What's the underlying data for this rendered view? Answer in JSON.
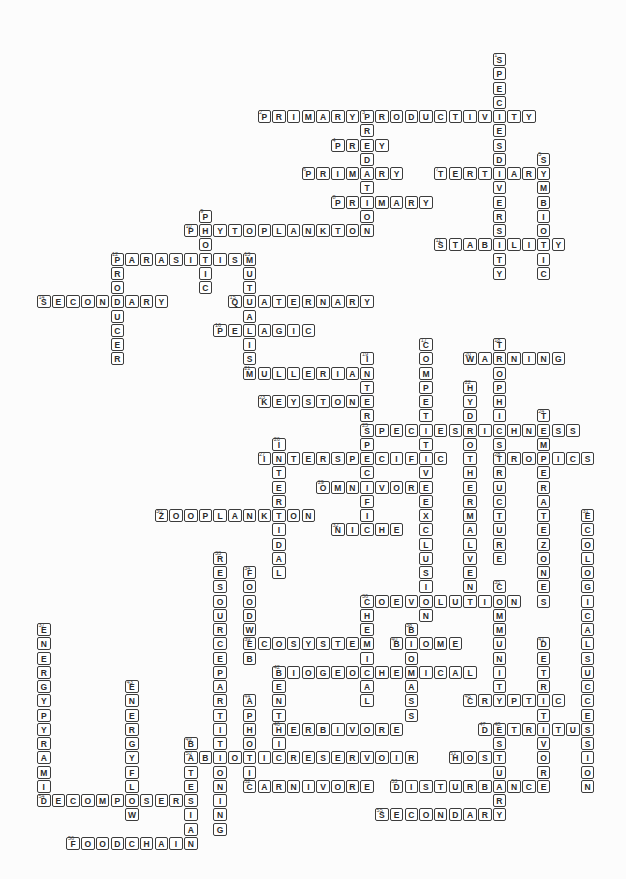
{
  "puzzle": {
    "type": "crossword",
    "state": "filled-in answers, no visible title or clue list",
    "grid": {
      "rows": 56,
      "cols": 38
    },
    "colors": {
      "paper": "#fcfcfc",
      "cell_fill": "#ffffff",
      "ink": "#3c3c3c",
      "letter_ink": "#2b2b2b",
      "number_ink": "#444444"
    },
    "words": [
      {
        "number": 1,
        "dir": "down",
        "row": 0,
        "col": 31,
        "answer": "SPECIESDIVERSITY"
      },
      {
        "number": 2,
        "dir": "across",
        "row": 4,
        "col": 15,
        "answer": "PRIMARYPRODUCTIVITY"
      },
      {
        "number": 3,
        "dir": "down",
        "row": 4,
        "col": 22,
        "answer": "PREDATION"
      },
      {
        "number": 4,
        "dir": "across",
        "row": 6,
        "col": 20,
        "answer": "PREY"
      },
      {
        "number": 5,
        "dir": "down",
        "row": 7,
        "col": 34,
        "answer": "SYMBIOTIC"
      },
      {
        "number": 6,
        "dir": "across",
        "row": 8,
        "col": 18,
        "answer": "PRIMARY"
      },
      {
        "number": 7,
        "dir": "across",
        "row": 8,
        "col": 27,
        "answer": "TERTIARY"
      },
      {
        "number": 8,
        "dir": "across",
        "row": 10,
        "col": 20,
        "answer": "PRIMARY"
      },
      {
        "number": 9,
        "dir": "down",
        "row": 11,
        "col": 11,
        "answer": "PHOTIC"
      },
      {
        "number": 10,
        "dir": "across",
        "row": 12,
        "col": 10,
        "answer": "PHYTOPLANKTON"
      },
      {
        "number": 11,
        "dir": "across",
        "row": 13,
        "col": 27,
        "answer": "STABILITY"
      },
      {
        "number": 12,
        "dir": "across",
        "row": 14,
        "col": 5,
        "answer": "PARASITISM"
      },
      {
        "number": 12,
        "dir": "down",
        "row": 14,
        "col": 5,
        "answer": "PRODUCER"
      },
      {
        "number": 13,
        "dir": "down",
        "row": 14,
        "col": 14,
        "answer": "MUTUALISM"
      },
      {
        "number": 14,
        "dir": "across",
        "row": 17,
        "col": 0,
        "answer": "SECONDARY"
      },
      {
        "number": 15,
        "dir": "across",
        "row": 17,
        "col": 13,
        "answer": "QUATERNARY"
      },
      {
        "number": 16,
        "dir": "across",
        "row": 19,
        "col": 12,
        "answer": "PELAGIC"
      },
      {
        "number": 17,
        "dir": "down",
        "row": 20,
        "col": 26,
        "answer": "COMPETITIVEEXCLUSION"
      },
      {
        "number": 18,
        "dir": "down",
        "row": 20,
        "col": 31,
        "answer": "TROPHICSTRUCTURE"
      },
      {
        "number": 19,
        "dir": "down",
        "row": 21,
        "col": 22,
        "answer": "INTERSPECIFIC"
      },
      {
        "number": 20,
        "dir": "across",
        "row": 21,
        "col": 29,
        "answer": "WARNING"
      },
      {
        "number": 21,
        "dir": "across",
        "row": 22,
        "col": 14,
        "answer": "MULLERIAN"
      },
      {
        "number": 22,
        "dir": "down",
        "row": 23,
        "col": 29,
        "answer": "HYDROTHERMALVENT"
      },
      {
        "number": 23,
        "dir": "across",
        "row": 24,
        "col": 15,
        "answer": "KEYSTONE"
      },
      {
        "number": 24,
        "dir": "down",
        "row": 25,
        "col": 34,
        "answer": "TEMPERATEZONES"
      },
      {
        "number": 25,
        "dir": "across",
        "row": 26,
        "col": 22,
        "answer": "SPECIESRICHNESS"
      },
      {
        "number": 26,
        "dir": "down",
        "row": 27,
        "col": 16,
        "answer": "INTERTIDAL"
      },
      {
        "number": 27,
        "dir": "across",
        "row": 28,
        "col": 15,
        "answer": "INTERSPECIFIC"
      },
      {
        "number": 28,
        "dir": "across",
        "row": 28,
        "col": 31,
        "answer": "TROPICS"
      },
      {
        "number": 29,
        "dir": "across",
        "row": 30,
        "col": 19,
        "answer": "OMNIVORE"
      },
      {
        "number": 30,
        "dir": "across",
        "row": 32,
        "col": 8,
        "answer": "ZOOPLANKTON"
      },
      {
        "number": 31,
        "dir": "down",
        "row": 32,
        "col": 37,
        "answer": "ECOLOGICALSUCCESSION"
      },
      {
        "number": 32,
        "dir": "across",
        "row": 33,
        "col": 20,
        "answer": "NICHE"
      },
      {
        "number": 33,
        "dir": "down",
        "row": 35,
        "col": 12,
        "answer": "RESOURCEPARTITIONING"
      },
      {
        "number": 34,
        "dir": "down",
        "row": 36,
        "col": 14,
        "answer": "FOODWEB"
      },
      {
        "number": 35,
        "dir": "down",
        "row": 37,
        "col": 31,
        "answer": "COMMUNITY"
      },
      {
        "number": 36,
        "dir": "across",
        "row": 38,
        "col": 22,
        "answer": "COEVOLUTION"
      },
      {
        "number": 36,
        "dir": "down",
        "row": 38,
        "col": 22,
        "answer": "CHEMICAL"
      },
      {
        "number": 37,
        "dir": "down",
        "row": 40,
        "col": 0,
        "answer": "ENERGYPYRAMID"
      },
      {
        "number": 38,
        "dir": "down",
        "row": 40,
        "col": 25,
        "answer": "BIOMASS"
      },
      {
        "number": 39,
        "dir": "across",
        "row": 41,
        "col": 14,
        "answer": "ECOSYSTEM"
      },
      {
        "number": 40,
        "dir": "across",
        "row": 41,
        "col": 24,
        "answer": "BIOME"
      },
      {
        "number": 41,
        "dir": "down",
        "row": 41,
        "col": 34,
        "answer": "DETRITIVORE"
      },
      {
        "number": 42,
        "dir": "across",
        "row": 43,
        "col": 16,
        "answer": "BIOGEOCHEMICAL"
      },
      {
        "number": 42,
        "dir": "down",
        "row": 43,
        "col": 16,
        "answer": "BENTHIC"
      },
      {
        "number": 43,
        "dir": "down",
        "row": 44,
        "col": 6,
        "answer": "ENERGYFLOW"
      },
      {
        "number": 44,
        "dir": "down",
        "row": 45,
        "col": 14,
        "answer": "APHOTIC"
      },
      {
        "number": 45,
        "dir": "across",
        "row": 45,
        "col": 29,
        "answer": "CRYPTIC"
      },
      {
        "number": 46,
        "dir": "across",
        "row": 47,
        "col": 16,
        "answer": "HERBIVORE"
      },
      {
        "number": 47,
        "dir": "across",
        "row": 47,
        "col": 30,
        "answer": "DETRITUS"
      },
      {
        "number": 48,
        "dir": "down",
        "row": 47,
        "col": 31,
        "answer": "ESTUARY"
      },
      {
        "number": 49,
        "dir": "down",
        "row": 48,
        "col": 10,
        "answer": "BATESIAN"
      },
      {
        "number": 50,
        "dir": "across",
        "row": 49,
        "col": 10,
        "answer": "ABIOTICRESERVOIR"
      },
      {
        "number": 51,
        "dir": "across",
        "row": 49,
        "col": 28,
        "answer": "HOST"
      },
      {
        "number": 52,
        "dir": "across",
        "row": 51,
        "col": 14,
        "answer": "CARNIVORE"
      },
      {
        "number": 53,
        "dir": "across",
        "row": 51,
        "col": 24,
        "answer": "DISTURBANCE"
      },
      {
        "number": 54,
        "dir": "across",
        "row": 52,
        "col": 0,
        "answer": "DECOMPOSERS"
      },
      {
        "number": 55,
        "dir": "across",
        "row": 53,
        "col": 23,
        "answer": "SECONDARY"
      },
      {
        "number": 56,
        "dir": "across",
        "row": 55,
        "col": 2,
        "answer": "FOODCHAIN"
      }
    ]
  }
}
